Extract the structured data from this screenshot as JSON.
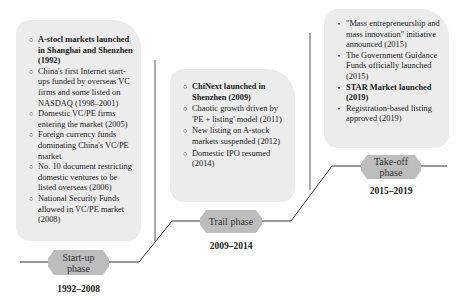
{
  "phases": [
    {
      "label": "Start-up phase",
      "label_lines": [
        "Start-up",
        "phase"
      ],
      "years": "1992–2008",
      "bullet_style": "hollow-circle",
      "events": [
        {
          "text": "A-stocl markets launched in Shanghai and Shenzhen (1992)",
          "bold": true
        },
        {
          "text": "China's first Internet start-ups funded by overseas VC firms and some listed on NASDAQ (1998–2001)",
          "bold": false
        },
        {
          "text": "Domestic VC/PE firms entering the market (2005)",
          "bold": false
        },
        {
          "text": "Foreign currency funds dominating China's VC/PE market",
          "bold": false
        },
        {
          "text": "No. 10 document restricting domestic ventures to be listed overseas (2006)",
          "bold": false
        },
        {
          "text": "National Security Funds allowed in VC/PE market (2008)",
          "bold": false
        }
      ]
    },
    {
      "label": "Trail phase",
      "label_lines": [
        "Trail phase"
      ],
      "years": "2009–2014",
      "bullet_style": "hollow-circle",
      "events": [
        {
          "text": "ChiNext launched in Shenzhen (2009)",
          "bold": true
        },
        {
          "text": "Chaotic growth driven by 'PE + listing' model (2011)",
          "bold": false
        },
        {
          "text": "New listing on A-stock markets suspended (2012)",
          "bold": false
        },
        {
          "text": "Domestic IPO resumed (2014)",
          "bold": false
        }
      ]
    },
    {
      "label": "Take-off phase",
      "label_lines": [
        "Take-off",
        "phase"
      ],
      "years": "2015–2019",
      "bullet_style": "filled-dot",
      "events": [
        {
          "text": "\"Mass entrepreneurship and mass innovation\" initiative announced (2015)",
          "bold": false
        },
        {
          "text": "The Government Guidance Funds officially launched (2015)",
          "bold": false
        },
        {
          "text": "STAR Market launched (2019)",
          "bold": true
        },
        {
          "text": "Registration-based listing approved (2019)",
          "bold": false
        }
      ]
    }
  ],
  "colors": {
    "box_fill": "#ececec",
    "pill_fill": "#bdbdbd",
    "line": "#333333"
  }
}
